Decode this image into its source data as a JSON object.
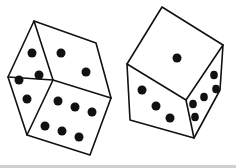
{
  "image": {
    "subject": "Hand-drawn pair of dice",
    "style": "black ink line drawing on white",
    "ink_color": "#111111",
    "background_color": "#ffffff"
  },
  "dice": [
    {
      "name": "left-die",
      "faces_visible": [
        {
          "face": "top",
          "pips": 2
        },
        {
          "face": "left",
          "pips": 4
        },
        {
          "face": "front",
          "pips": 6
        }
      ]
    },
    {
      "name": "right-die",
      "faces_visible": [
        {
          "face": "top",
          "pips": 1
        },
        {
          "face": "front",
          "pips": 3
        },
        {
          "face": "right",
          "pips": 5
        }
      ]
    }
  ]
}
